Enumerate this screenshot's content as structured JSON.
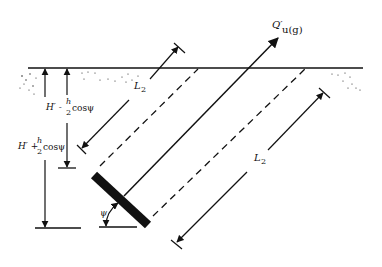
{
  "diagram": {
    "type": "inclined plate anchor in soil",
    "labels": {
      "force": "Q′",
      "force_sub": "u(g)",
      "depth_upper_pre": "H′ -",
      "depth_upper_frac_num": "h",
      "depth_upper_frac_den": "2",
      "depth_upper_post": "cosψ",
      "depth_lower_pre": "H′ +",
      "depth_lower_frac_num": "h",
      "depth_lower_frac_den": "2",
      "depth_lower_post": "cosψ",
      "length_top": "L",
      "length_top_sub": "2",
      "length_right": "L",
      "length_right_sub": "2",
      "angle": "ψ"
    },
    "colors": {
      "stroke": "#111111",
      "background": "#ffffff"
    }
  }
}
